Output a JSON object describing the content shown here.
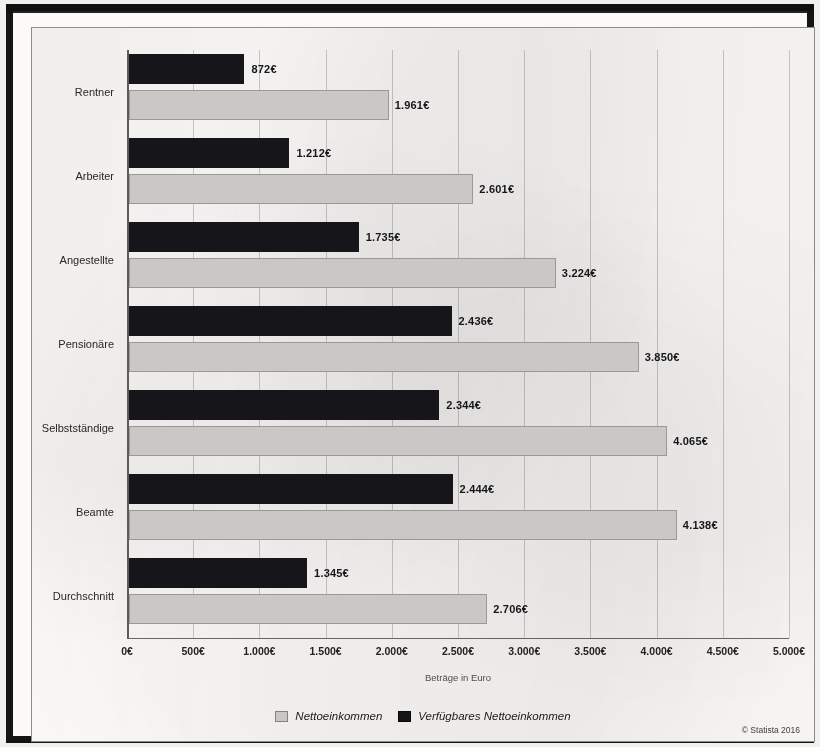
{
  "chart_data": {
    "type": "bar",
    "orientation": "horizontal",
    "title": "",
    "xlabel": "Beträge in Euro",
    "ylabel": "",
    "xlim": [
      0,
      5000
    ],
    "xtick_step": 500,
    "grid": true,
    "legend_position": "bottom",
    "categories": [
      "Rentner",
      "Arbeiter",
      "Angestellte",
      "Pensionäre",
      "Selbstständige",
      "Beamte",
      "Durchschnitt"
    ],
    "tick_labels": [
      "0€",
      "500€",
      "1.000€",
      "1.500€",
      "2.000€",
      "2.500€",
      "3.000€",
      "3.500€",
      "4.000€",
      "4.500€",
      "5.000€"
    ],
    "series": [
      {
        "name": "Verfügbares Nettoeinkommen",
        "color": "#16161a",
        "values": [
          872,
          1212,
          1735,
          2436,
          2344,
          2444,
          1345
        ],
        "labels": [
          "872€",
          "1.212€",
          "1.735€",
          "2.436€",
          "2.344€",
          "2.444€",
          "1.345€"
        ]
      },
      {
        "name": "Nettoeinkommen",
        "color": "#c9c8c6",
        "values": [
          1961,
          2601,
          3224,
          3850,
          4065,
          4138,
          2706
        ],
        "labels": [
          "1.961€",
          "2.601€",
          "3.224€",
          "3.850€",
          "4.065€",
          "4.138€",
          "2.706€"
        ]
      }
    ]
  },
  "legend": {
    "items": [
      {
        "label": "Nettoeinkommen",
        "swatch": "light"
      },
      {
        "label": "Verfügbares Nettoeinkommen",
        "swatch": "dark"
      }
    ]
  },
  "footer": {
    "copyright": "© Statista 2016"
  }
}
